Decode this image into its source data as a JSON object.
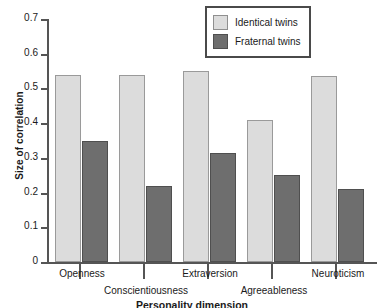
{
  "chart_data": {
    "type": "bar",
    "title": "",
    "xlabel": "Personality dimension",
    "ylabel": "Size of correlation",
    "categories": [
      "Openness",
      "Conscientiousness",
      "Extraversion",
      "Agreeableness",
      "Neuroticism"
    ],
    "series": [
      {
        "name": "Identical twins",
        "color": "#dcdcdc",
        "values": [
          0.54,
          0.54,
          0.55,
          0.41,
          0.535
        ]
      },
      {
        "name": "Fraternal twins",
        "color": "#6e6e6e",
        "values": [
          0.35,
          0.22,
          0.315,
          0.25,
          0.21
        ]
      }
    ],
    "ylim": [
      0,
      0.7
    ],
    "yticks": [
      0,
      0.1,
      0.2,
      0.3,
      0.4,
      0.5,
      0.6,
      0.7
    ],
    "ytick_labels": [
      "0",
      "0.1",
      "0.2",
      "0.3",
      "0.4",
      "0.5",
      "0.6",
      "0.7"
    ],
    "grid": false,
    "legend_position": "top-right"
  },
  "legend": {
    "items": [
      {
        "label": "Identical twins"
      },
      {
        "label": "Fraternal twins"
      }
    ]
  }
}
